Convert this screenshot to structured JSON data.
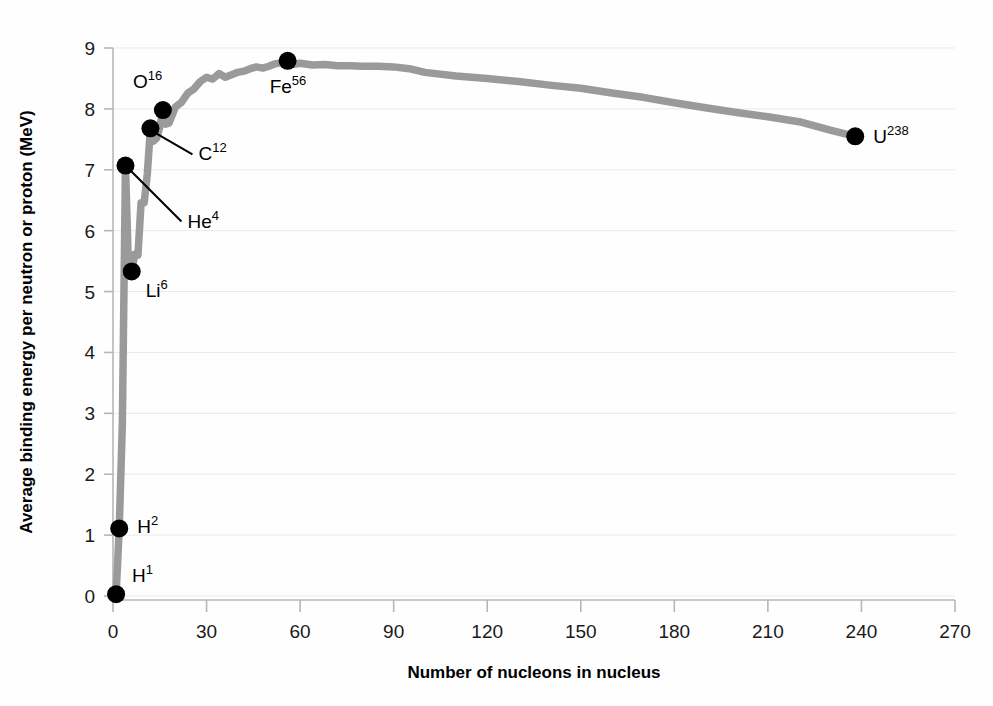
{
  "chart_data": {
    "type": "line",
    "title": "",
    "xlabel": "Number of nucleons in nucleus",
    "ylabel": "Average binding energy per neutron or proton (MeV)",
    "xlim": [
      0,
      270
    ],
    "ylim": [
      0,
      9
    ],
    "xticks": [
      0,
      30,
      60,
      90,
      120,
      150,
      180,
      210,
      240,
      270
    ],
    "yticks": [
      0,
      1,
      2,
      3,
      4,
      5,
      6,
      7,
      8,
      9
    ],
    "grid": "horizontal",
    "legend": "none",
    "curve_color": "#9a9a9a",
    "marker_color": "#000000",
    "series": [
      {
        "name": "binding energy per nucleon",
        "x": [
          1,
          2,
          3,
          4,
          5,
          6,
          7,
          8,
          9,
          10,
          11,
          12,
          13,
          14,
          15,
          16,
          17,
          18,
          19,
          20,
          22,
          24,
          26,
          28,
          30,
          32,
          34,
          36,
          38,
          40,
          42,
          44,
          46,
          48,
          50,
          52,
          54,
          56,
          58,
          60,
          64,
          68,
          72,
          76,
          80,
          85,
          90,
          95,
          100,
          110,
          120,
          130,
          140,
          150,
          160,
          170,
          180,
          190,
          200,
          210,
          220,
          230,
          238
        ],
        "y": [
          0.03,
          1.11,
          2.83,
          7.07,
          5.33,
          5.33,
          5.61,
          5.6,
          6.46,
          6.46,
          6.93,
          7.68,
          7.47,
          7.52,
          7.7,
          7.98,
          7.75,
          7.77,
          7.9,
          8.03,
          8.11,
          8.26,
          8.33,
          8.45,
          8.52,
          8.49,
          8.58,
          8.52,
          8.56,
          8.6,
          8.62,
          8.66,
          8.69,
          8.67,
          8.7,
          8.74,
          8.76,
          8.79,
          8.73,
          8.75,
          8.72,
          8.73,
          8.71,
          8.71,
          8.7,
          8.7,
          8.69,
          8.66,
          8.6,
          8.54,
          8.5,
          8.45,
          8.39,
          8.34,
          8.26,
          8.19,
          8.1,
          8.02,
          7.94,
          7.87,
          7.79,
          7.65,
          7.55
        ]
      }
    ],
    "points": [
      {
        "label": "H",
        "mass": "1",
        "x": 1,
        "y": 0.03,
        "label_dx": 16,
        "label_dy": -12,
        "leader": false
      },
      {
        "label": "H",
        "mass": "2",
        "x": 2,
        "y": 1.11,
        "label_dx": 18,
        "label_dy": 5,
        "leader": false
      },
      {
        "label": "Li",
        "mass": "6",
        "x": 6,
        "y": 5.33,
        "label_dx": 14,
        "label_dy": 26,
        "leader": false
      },
      {
        "label": "He",
        "mass": "4",
        "x": 4,
        "y": 7.07,
        "label_dx": 62,
        "label_dy": 62,
        "leader": true
      },
      {
        "label": "C",
        "mass": "12",
        "x": 12,
        "y": 7.68,
        "label_dx": 48,
        "label_dy": 32,
        "leader": true
      },
      {
        "label": "O",
        "mass": "16",
        "x": 16,
        "y": 7.98,
        "label_dx": -30,
        "label_dy": -22,
        "leader": false
      },
      {
        "label": "Fe",
        "mass": "56",
        "x": 56,
        "y": 8.79,
        "label_dx": -18,
        "label_dy": 32,
        "leader": false
      },
      {
        "label": "U",
        "mass": "238",
        "x": 238,
        "y": 7.55,
        "label_dx": 18,
        "label_dy": 7,
        "leader": false
      }
    ]
  }
}
